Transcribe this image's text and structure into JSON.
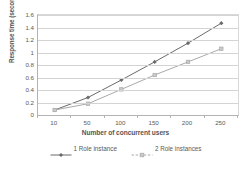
{
  "chart_data": {
    "type": "line",
    "title": "",
    "xlabel": "Number of concurrent users",
    "ylabel": "Response time (seconds)",
    "categories": [
      "10",
      "50",
      "100",
      "150",
      "200",
      "250"
    ],
    "x": [
      10,
      50,
      100,
      150,
      200,
      250
    ],
    "xtick_labels": [
      "10",
      "50",
      "100",
      "150",
      "200",
      "250"
    ],
    "ytick_labels": [
      "0",
      "0.2",
      "0.4",
      "0.6",
      "0.8",
      "1",
      "1.2",
      "1.4",
      "1.6"
    ],
    "ylim": [
      0,
      1.6
    ],
    "ystep": 0.2,
    "grid": true,
    "legend_position": "bottom",
    "series": [
      {
        "name": "1 Role instance",
        "values": [
          0.08,
          0.28,
          0.56,
          0.85,
          1.15,
          1.47
        ],
        "color": "#6b6b6b",
        "marker": "diamond"
      },
      {
        "name": "2 Role instances",
        "values": [
          0.08,
          0.18,
          0.41,
          0.64,
          0.85,
          1.06
        ],
        "color": "#aaaaaa",
        "marker": "square"
      }
    ]
  },
  "colors": {
    "series1": "#6b6b6b",
    "series2": "#aaaaaa",
    "grid": "#d4d4d4",
    "axis": "#b3b3b3",
    "text": "#5a5a5a",
    "background": "#ffffff"
  }
}
